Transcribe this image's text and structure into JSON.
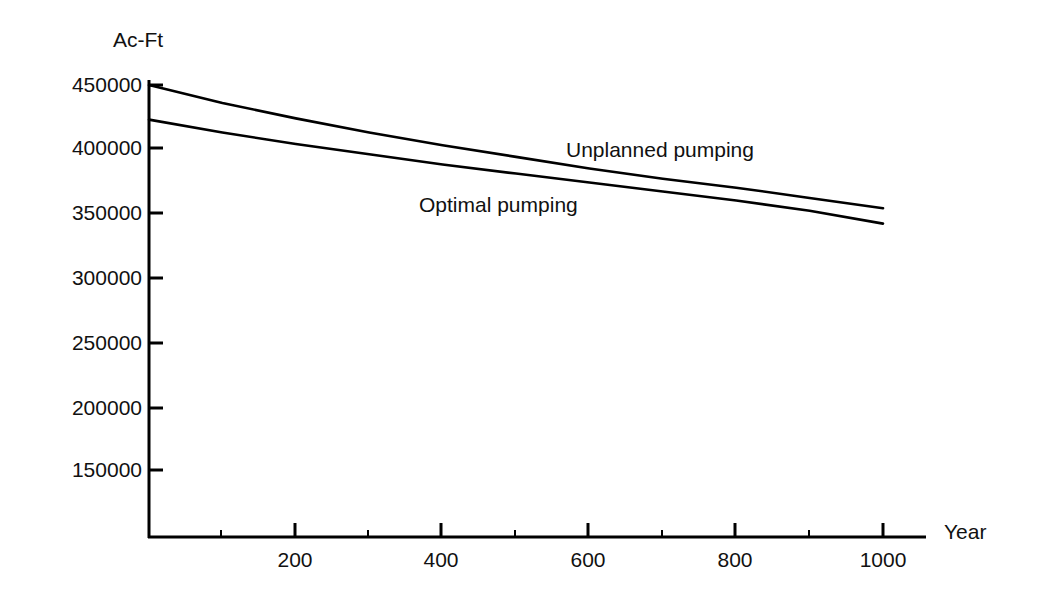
{
  "chart_data": {
    "type": "line",
    "title": "",
    "subtitle": "",
    "xlabel": "Year",
    "ylabel": "Ac-Ft",
    "grid": false,
    "legend": "inline-annotations",
    "xlim": [
      0,
      1040
    ],
    "ylim": [
      130000,
      450000
    ],
    "x_major_ticks": [
      200,
      400,
      600,
      800,
      1000
    ],
    "x_minor_ticks": [
      100,
      300,
      500,
      700,
      900
    ],
    "x_tick_labels": [
      "200",
      "400",
      "600",
      "800",
      "1000"
    ],
    "y_ticks": [
      450000,
      400000,
      350000,
      300000,
      250000,
      200000,
      150000
    ],
    "y_tick_labels": [
      "450000",
      "400000",
      "350000",
      "300000",
      "250000",
      "200000",
      "150000"
    ],
    "x": [
      0,
      100,
      200,
      300,
      400,
      500,
      600,
      700,
      800,
      900,
      1000
    ],
    "series": [
      {
        "name": "Unplanned pumping",
        "label": "Unplanned pumping",
        "color": "#000000",
        "values": [
          450000,
          436000,
          424000,
          413000,
          403000,
          394000,
          385000,
          377000,
          370000,
          362000,
          354000
        ]
      },
      {
        "name": "Optimal pumping",
        "label": "Optimal pumping",
        "color": "#000000",
        "values": [
          423000,
          413000,
          404000,
          396000,
          388000,
          381000,
          374000,
          367000,
          360000,
          352000,
          342000
        ]
      }
    ],
    "annotations": [
      {
        "text": "Unplanned pumping",
        "x": 1000,
        "y": 400000
      },
      {
        "text": "Optimal pumping",
        "x": 740,
        "y": 368000
      }
    ]
  },
  "axes": {
    "y_axis_title": "Ac-Ft",
    "x_axis_title": "Year"
  }
}
